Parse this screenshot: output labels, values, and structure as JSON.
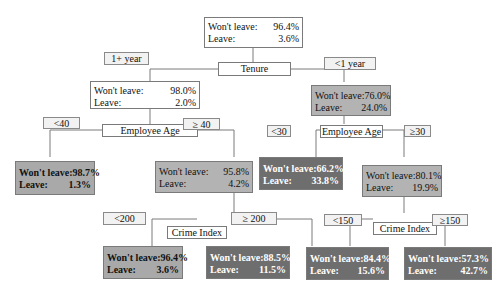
{
  "tree": {
    "root": {
      "wont_leave_label": "Won't leave:",
      "wont_leave": "96.4%",
      "leave_label": "Leave:",
      "leave": "3.6%"
    },
    "root_split": "Tenure",
    "branch_left_label": "1+ year",
    "branch_right_label": "<1 year",
    "left": {
      "wont_leave_label": "Won't leave:",
      "wont_leave": "98.0%",
      "leave_label": "Leave:",
      "leave": "2.0%",
      "split": "Employee Age",
      "branch_left_label": "<40",
      "branch_right_label": "≥ 40",
      "left_leaf": {
        "wont_leave_label": "Won't leave:",
        "wont_leave": "98.7%",
        "leave_label": "Leave:",
        "leave": "1.3%"
      },
      "right": {
        "wont_leave_label": "Won't leave:",
        "wont_leave": "95.8%",
        "leave_label": "Leave:",
        "leave": "4.2%",
        "split": "Crime Index",
        "branch_left_label": "<200",
        "branch_right_label": "≥ 200",
        "left_leaf": {
          "wont_leave_label": "Won't leave:",
          "wont_leave": "96.4%",
          "leave_label": "Leave:",
          "leave": "3.6%"
        },
        "right_leaf": {
          "wont_leave_label": "Won't leave:",
          "wont_leave": "88.5%",
          "leave_label": "Leave:",
          "leave": "11.5%"
        }
      }
    },
    "right": {
      "wont_leave_label": "Won't leave:",
      "wont_leave": "76.0%",
      "leave_label": "Leave:",
      "leave": "24.0%",
      "split": "Employee Age",
      "branch_left_label": "<30",
      "branch_right_label": "≥30",
      "left_leaf": {
        "wont_leave_label": "Won't leave:",
        "wont_leave": "66.2%",
        "leave_label": "Leave:",
        "leave": "33.8%"
      },
      "right": {
        "wont_leave_label": "Won't leave:",
        "wont_leave": "80.1%",
        "leave_label": "Leave:",
        "leave": "19.9%",
        "split": "Crime Index",
        "branch_left_label": "<150",
        "branch_right_label": "≥150",
        "left_leaf": {
          "wont_leave_label": "Won't leave:",
          "wont_leave": "84.4%",
          "leave_label": "Leave:",
          "leave": "15.6%"
        },
        "right_leaf": {
          "wont_leave_label": "Won't leave:",
          "wont_leave": "57.3%",
          "leave_label": "Leave:",
          "leave": "42.7%"
        }
      }
    }
  },
  "colors": {
    "white_node": "#ffffff",
    "light_gray_node": "#b3b3b3",
    "dark_gray_node": "#6e6e6e",
    "edge_label_bg": "#f2f2f2",
    "line": "#7a7a7a"
  }
}
